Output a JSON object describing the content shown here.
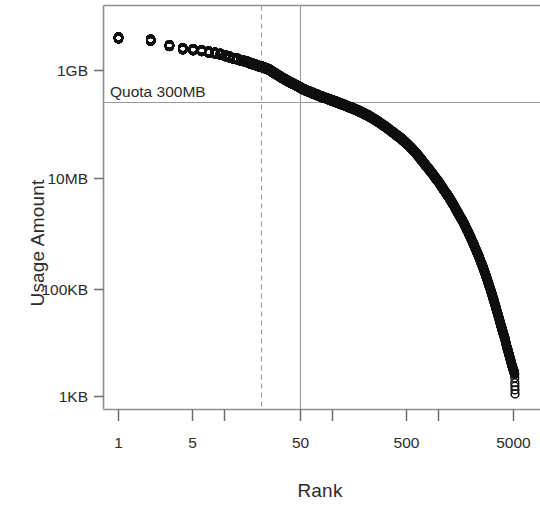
{
  "chart_data": {
    "type": "scatter",
    "title": "",
    "xlabel": "Rank",
    "ylabel": "Usage Amount",
    "x_scale": "log",
    "y_scale": "log",
    "grid": false,
    "legend": null,
    "x_tick_labels": [
      "1",
      "5",
      "50",
      "500",
      "5000"
    ],
    "x_tick_values": [
      1,
      5,
      50,
      500,
      5000
    ],
    "x_minor_tick_values": [
      10,
      100,
      1000
    ],
    "xlim": [
      1,
      7000
    ],
    "y_tick_labels": [
      "1KB",
      "100KB",
      "10MB",
      "1GB"
    ],
    "y_tick_values": [
      1024,
      102400,
      10485760,
      1073741824
    ],
    "ylim": [
      700,
      6000000000
    ],
    "marker": "open-circle",
    "marker_color": "#111111",
    "annotations": [
      {
        "name": "quota-line-label",
        "text": "Quota 300MB",
        "x": 1.3,
        "y": 420000000
      }
    ],
    "reference_lines": [
      {
        "name": "quota-horizontal-line",
        "orientation": "horizontal",
        "value": 314572800,
        "value_label": "300MB",
        "style": "solid",
        "color": "#9a9a9a"
      },
      {
        "name": "rank-25-vertical-line",
        "orientation": "vertical",
        "value": 25,
        "value_label": "25",
        "style": "dashed",
        "color": "#9a9a9a"
      },
      {
        "name": "rank-50-vertical-line",
        "orientation": "vertical",
        "value": 50,
        "value_label": "50",
        "style": "solid",
        "color": "#9a9a9a"
      }
    ],
    "series": [
      {
        "name": "usage",
        "point_count": 5200,
        "x": [
          1,
          2,
          3,
          4,
          5,
          6,
          7,
          8,
          9,
          10,
          11,
          12,
          13,
          14,
          15,
          16,
          17,
          18,
          19,
          20,
          22,
          24,
          26,
          28,
          30,
          33,
          36,
          40,
          44,
          48,
          52,
          57,
          62,
          68,
          75,
          82,
          90,
          100,
          110,
          120,
          135,
          150,
          165,
          180,
          200,
          225,
          250,
          280,
          310,
          350,
          390,
          440,
          490,
          550,
          620,
          700,
          790,
          880,
          990,
          1100,
          1250,
          1400,
          1550,
          1750,
          1950,
          2150,
          2400,
          2650,
          2900,
          3150,
          3400,
          3650,
          3900,
          4150,
          4350,
          4550,
          4720,
          4850,
          4950,
          5020,
          5080,
          5130,
          5170
        ],
        "y": [
          4300000000,
          3900000000,
          3100000000,
          2700000000,
          2600000000,
          2500000000,
          2350000000,
          2250000000,
          2150000000,
          2000000000,
          1900000000,
          1800000000,
          1750000000,
          1650000000,
          1600000000,
          1550000000,
          1480000000,
          1420000000,
          1380000000,
          1320000000,
          1250000000,
          1180000000,
          1100000000,
          1000000000,
          920000000,
          820000000,
          740000000,
          660000000,
          600000000,
          550000000,
          500000000,
          460000000,
          430000000,
          400000000,
          370000000,
          345000000,
          325000000,
          300000000,
          280000000,
          262000000,
          240000000,
          222000000,
          205000000,
          190000000,
          172000000,
          152000000,
          134000000,
          116000000,
          101000000,
          85000000,
          72000000,
          60000000,
          50000000,
          40000000,
          31000000,
          23000000,
          17000000,
          13000000,
          9500000,
          7000000,
          4800000,
          3300000,
          2300000,
          1500000,
          950000,
          620000,
          370000,
          220000,
          130000,
          78000,
          47000,
          29000,
          18000,
          12000,
          8200,
          6000,
          4600,
          3800,
          3300,
          3100,
          2900,
          2600,
          1100
        ]
      }
    ]
  },
  "axes": {
    "y_title": "Usage Amount",
    "x_title": "Rank"
  }
}
